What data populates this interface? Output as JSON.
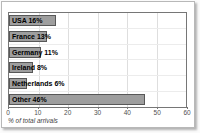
{
  "chart_data": {
    "type": "bar",
    "orientation": "horizontal",
    "categories": [
      "USA",
      "France",
      "Germany",
      "Ireland",
      "Netherlands",
      "Other"
    ],
    "values": [
      16,
      13,
      11,
      8,
      6,
      46
    ],
    "bar_labels": [
      "USA 16%",
      "France 13%",
      "Germany 11%",
      "Ireland 8%",
      "Netherlands 6%",
      "Other 46%"
    ],
    "title": "",
    "xlabel": "% of total arrivals",
    "ylabel": "",
    "xlim": [
      0,
      60
    ],
    "xticks": [
      0,
      10,
      20,
      30,
      40,
      50,
      60
    ],
    "grid": true,
    "legend": false,
    "bar_color": "#9e9e9e",
    "bar_border_color": "#585858",
    "gridline_color": "#dedede",
    "plot_border_color": "#767676",
    "label_color": "#000000",
    "tick_color": "#4f4f4f"
  }
}
